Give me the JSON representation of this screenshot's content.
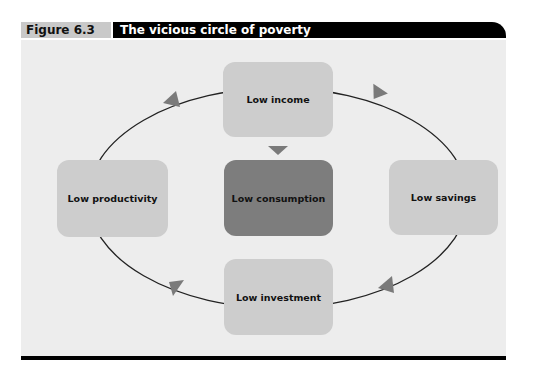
{
  "figure": {
    "label": "Figure 6.3",
    "title": "The vicious circle of poverty"
  },
  "diagram": {
    "type": "cycle",
    "nodes": [
      {
        "id": "income",
        "label": "Low income"
      },
      {
        "id": "savings",
        "label": "Low savings"
      },
      {
        "id": "investment",
        "label": "Low investment"
      },
      {
        "id": "productivity",
        "label": "Low productivity"
      },
      {
        "id": "consumption",
        "label": "Low consumption"
      }
    ],
    "edges": [
      {
        "from": "income",
        "to": "savings"
      },
      {
        "from": "savings",
        "to": "investment"
      },
      {
        "from": "investment",
        "to": "productivity"
      },
      {
        "from": "productivity",
        "to": "income"
      },
      {
        "from": "income",
        "to": "consumption"
      }
    ],
    "colors": {
      "light_box": "#cdcdcd",
      "dark_box": "#7d7d7d",
      "arrow": "#7a7a7a",
      "background": "#ededed"
    }
  }
}
